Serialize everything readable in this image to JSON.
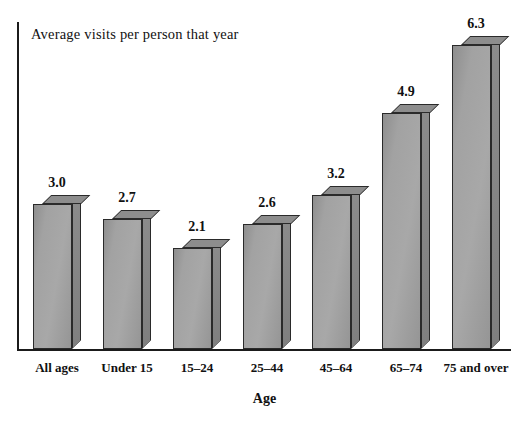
{
  "chart_data": {
    "type": "bar",
    "title": "Average visits per person that year",
    "xlabel": "Age",
    "ylabel": "",
    "categories": [
      "All ages",
      "Under 15",
      "15–24",
      "25–44",
      "45–64",
      "65–74",
      "75 and over"
    ],
    "values": [
      3.0,
      2.7,
      2.1,
      2.6,
      3.2,
      4.9,
      6.3
    ],
    "value_labels": [
      "3.0",
      "2.7",
      "2.1",
      "2.6",
      "3.2",
      "4.9",
      "6.3"
    ],
    "ylim": [
      0,
      6.9
    ],
    "grid": false,
    "legend": false,
    "style": "3d-bars",
    "colors": {
      "bar_front": "#a3a3a3",
      "bar_top": "#8d8d8d",
      "bar_side": "#838383",
      "outline": "#2a2a2a",
      "axis": "#1b1b1b",
      "background": "#ffffff",
      "text": "#111111"
    }
  }
}
